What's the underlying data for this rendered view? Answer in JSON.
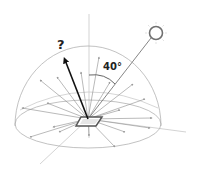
{
  "diagram": {
    "angle_label": "40°",
    "unknown_label": "?",
    "elements": {
      "light_source": "sun-icon",
      "surface": "surface-patch",
      "unknown_direction": "reflection-arrow",
      "hemisphere": "hemisphere-outline",
      "scattered_rays": "diffuse-ray-arrows"
    },
    "colors": {
      "outline": "#9a9a9a",
      "arrow_dark": "#1a1a1a",
      "ray_gray": "#8c8c8c",
      "sun": "#7a7a7a",
      "patch": "#555555"
    }
  }
}
